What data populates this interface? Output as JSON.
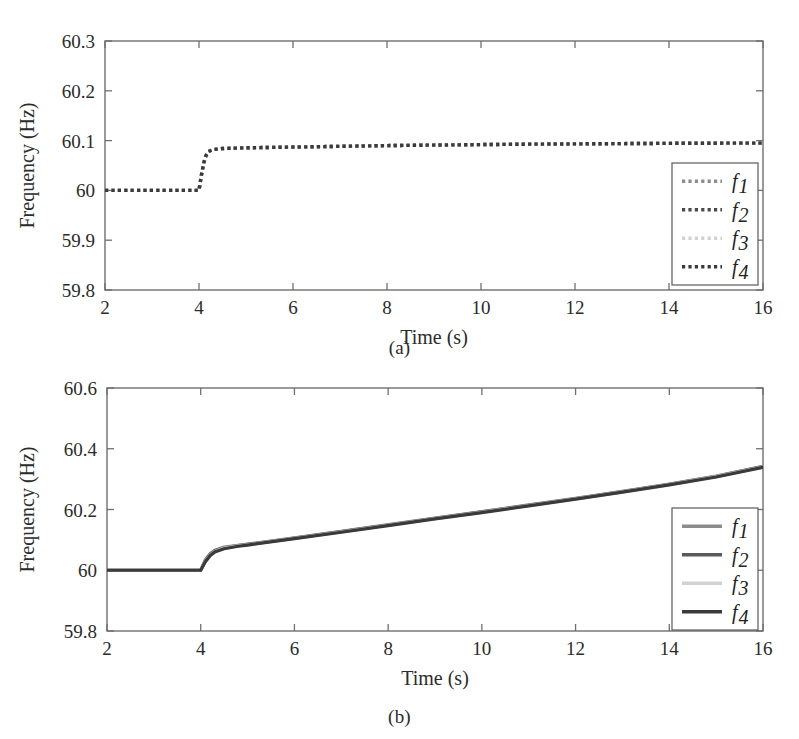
{
  "figure": {
    "panels": [
      {
        "id": "a",
        "caption": "(a)",
        "ylabel": "Frequency (Hz)",
        "xlabel": "Time (s)",
        "yticks": [
          "59.8",
          "59.9",
          "60",
          "60.1",
          "60.2",
          "60.3"
        ],
        "xticks": [
          "2",
          "4",
          "6",
          "8",
          "10",
          "12",
          "14",
          "16"
        ],
        "legend": [
          {
            "label": "f",
            "sub": "1",
            "color": "#8c8c8c",
            "style": "dotted"
          },
          {
            "label": "f",
            "sub": "2",
            "color": "#4a4a4a",
            "style": "dotted"
          },
          {
            "label": "f",
            "sub": "3",
            "color": "#d2d2d2",
            "style": "dotted"
          },
          {
            "label": "f",
            "sub": "4",
            "color": "#3a3a3a",
            "style": "dotted"
          }
        ]
      },
      {
        "id": "b",
        "caption": "(b)",
        "ylabel": "Frequency (Hz)",
        "xlabel": "Time (s)",
        "yticks": [
          "59.8",
          "60",
          "60.2",
          "60.4",
          "60.6"
        ],
        "xticks": [
          "2",
          "4",
          "6",
          "8",
          "10",
          "12",
          "14",
          "16"
        ],
        "legend": [
          {
            "label": "f",
            "sub": "1",
            "color": "#8c8c8c",
            "style": "solid"
          },
          {
            "label": "f",
            "sub": "2",
            "color": "#5a5a5a",
            "style": "solid"
          },
          {
            "label": "f",
            "sub": "3",
            "color": "#d2d2d2",
            "style": "solid"
          },
          {
            "label": "f",
            "sub": "4",
            "color": "#3a3a3a",
            "style": "solid"
          }
        ]
      }
    ]
  },
  "chart_data": [
    {
      "type": "line",
      "panel": "(a)",
      "title": "",
      "xlabel": "Time (s)",
      "ylabel": "Frequency (Hz)",
      "xlim": [
        2,
        16
      ],
      "ylim": [
        59.8,
        60.3
      ],
      "xticks": [
        2,
        4,
        6,
        8,
        10,
        12,
        14,
        16
      ],
      "yticks": [
        59.8,
        59.9,
        60,
        60.1,
        60.2,
        60.3
      ],
      "grid": false,
      "legend_position": "lower-right",
      "linestyle": "dotted",
      "x": [
        2,
        2.5,
        3,
        3.5,
        3.9,
        4.0,
        4.05,
        4.1,
        4.15,
        4.2,
        4.3,
        4.5,
        5,
        6,
        7,
        8,
        9,
        10,
        11,
        12,
        13,
        14,
        15,
        16
      ],
      "series": [
        {
          "name": "f1",
          "color": "#8c8c8c",
          "values": [
            60.0,
            60.0,
            60.0,
            60.0,
            60.0,
            60.0,
            60.03,
            60.055,
            60.07,
            60.078,
            60.082,
            60.084,
            60.0855,
            60.087,
            60.0885,
            60.09,
            60.091,
            60.092,
            60.0928,
            60.0934,
            60.094,
            60.0945,
            60.0948,
            60.095
          ]
        },
        {
          "name": "f2",
          "color": "#4a4a4a",
          "values": [
            60.0,
            60.0,
            60.0,
            60.0,
            60.0,
            60.0,
            60.03,
            60.055,
            60.07,
            60.078,
            60.082,
            60.084,
            60.0855,
            60.087,
            60.0885,
            60.09,
            60.091,
            60.092,
            60.0928,
            60.0934,
            60.094,
            60.0945,
            60.0948,
            60.095
          ]
        },
        {
          "name": "f3",
          "color": "#d2d2d2",
          "values": [
            60.0,
            60.0,
            60.0,
            60.0,
            60.0,
            60.0,
            60.03,
            60.055,
            60.07,
            60.078,
            60.082,
            60.084,
            60.0855,
            60.087,
            60.0885,
            60.09,
            60.091,
            60.092,
            60.0928,
            60.0934,
            60.094,
            60.0945,
            60.0948,
            60.095
          ]
        },
        {
          "name": "f4",
          "color": "#3a3a3a",
          "values": [
            60.0,
            60.0,
            60.0,
            60.0,
            60.0,
            60.0,
            60.03,
            60.055,
            60.07,
            60.078,
            60.082,
            60.084,
            60.0855,
            60.087,
            60.0885,
            60.09,
            60.091,
            60.092,
            60.0928,
            60.0934,
            60.094,
            60.0945,
            60.0948,
            60.095
          ]
        }
      ]
    },
    {
      "type": "line",
      "panel": "(b)",
      "title": "",
      "xlabel": "Time (s)",
      "ylabel": "Frequency (Hz)",
      "xlim": [
        2,
        16
      ],
      "ylim": [
        59.8,
        60.6
      ],
      "xticks": [
        2,
        4,
        6,
        8,
        10,
        12,
        14,
        16
      ],
      "yticks": [
        59.8,
        60,
        60.2,
        60.4,
        60.6
      ],
      "grid": false,
      "legend_position": "lower-right",
      "linestyle": "solid",
      "x": [
        2,
        2.5,
        3,
        3.5,
        3.9,
        4.0,
        4.1,
        4.2,
        4.3,
        4.5,
        4.8,
        5,
        6,
        7,
        8,
        9,
        10,
        11,
        12,
        13,
        14,
        15,
        16
      ],
      "series": [
        {
          "name": "f1",
          "color": "#8c8c8c",
          "values": [
            60.0,
            60.0,
            60.0,
            60.0,
            60.0,
            60.0,
            60.035,
            60.055,
            60.066,
            60.076,
            60.082,
            60.086,
            60.107,
            60.128,
            60.15,
            60.172,
            60.193,
            60.215,
            60.237,
            60.26,
            60.284,
            60.31,
            60.342
          ]
        },
        {
          "name": "f2",
          "color": "#5a5a5a",
          "values": [
            60.0,
            60.0,
            60.0,
            60.0,
            60.0,
            60.0,
            60.032,
            60.052,
            60.064,
            60.074,
            60.081,
            60.085,
            60.106,
            60.127,
            60.149,
            60.171,
            60.192,
            60.214,
            60.236,
            60.259,
            60.283,
            60.309,
            60.341
          ]
        },
        {
          "name": "f3",
          "color": "#d2d2d2",
          "values": [
            60.0,
            60.0,
            60.0,
            60.0,
            60.0,
            60.0,
            60.03,
            60.05,
            60.062,
            60.073,
            60.08,
            60.084,
            60.105,
            60.126,
            60.148,
            60.17,
            60.191,
            60.213,
            60.235,
            60.258,
            60.282,
            60.308,
            60.34
          ]
        },
        {
          "name": "f4",
          "color": "#3a3a3a",
          "values": [
            60.0,
            60.0,
            60.0,
            60.0,
            60.0,
            60.0,
            60.028,
            60.048,
            60.06,
            60.071,
            60.079,
            60.083,
            60.104,
            60.125,
            60.147,
            60.169,
            60.19,
            60.212,
            60.234,
            60.257,
            60.281,
            60.307,
            60.339
          ]
        }
      ]
    }
  ]
}
